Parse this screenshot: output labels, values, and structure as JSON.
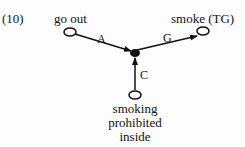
{
  "figure_number": "(10)",
  "nodes": {
    "go_out": "go out",
    "smoke": "smoke (TG)",
    "prohibited": [
      "smoking",
      "prohibited",
      "inside"
    ]
  },
  "edges": {
    "a": "A",
    "g": "G",
    "c": "C"
  }
}
